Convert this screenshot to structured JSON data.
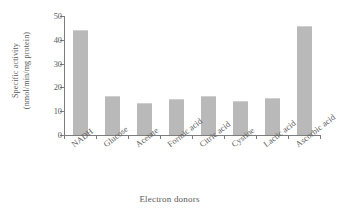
{
  "chart_data": {
    "type": "bar",
    "title": "",
    "xlabel": "Electron donors",
    "ylabel": "Specific activity (nmol/min/mg protein)",
    "ylabel_line1": "Specific activity",
    "ylabel_line2": "(nmol/min/mg protein)",
    "categories": [
      "NADH",
      "Glucose",
      "Acetate",
      "Formic acid",
      "Citric acid",
      "Cystine",
      "Lactic acid",
      "Ascorbic acid"
    ],
    "values": [
      44.0,
      16.3,
      13.5,
      15.2,
      16.4,
      14.5,
      15.6,
      46.0
    ],
    "ylim": [
      0,
      50
    ],
    "yticks": [
      0,
      10,
      20,
      30,
      40,
      50
    ],
    "ytick_labels": [
      "0",
      "10",
      "20",
      "30",
      "40",
      "50"
    ],
    "grid": false,
    "legend": false,
    "bar_color": "#b9b9b9",
    "axis_color": "#7d7d7d",
    "text_color": "#5a5a5a",
    "background": "#ffffff"
  }
}
